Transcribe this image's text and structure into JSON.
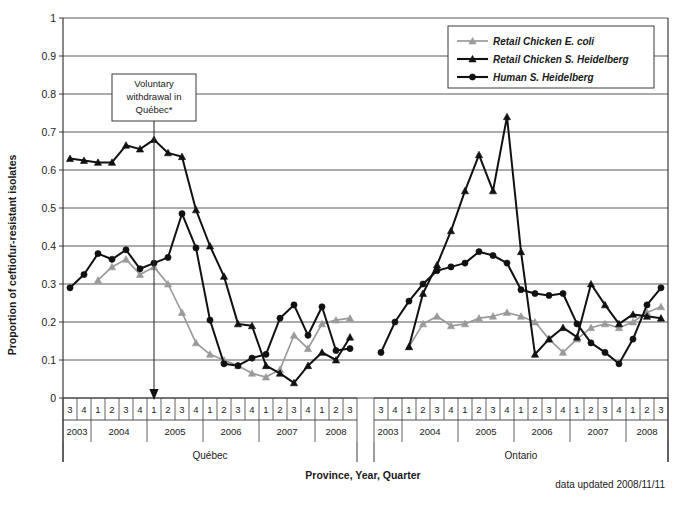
{
  "axes": {
    "ylabel": "Proportion of ceftiofur-resistant isolates",
    "xtitle": "Province, Year, Quarter",
    "yticks": [
      "0",
      "0.1",
      "0.2",
      "0.3",
      "0.4",
      "0.5",
      "0.6",
      "0.7",
      "0.8",
      "0.9",
      "1"
    ],
    "ylim": [
      0,
      1
    ]
  },
  "annotation": {
    "line1": "Voluntary",
    "line2": "withdrawal in",
    "line3": "Québec*"
  },
  "footer": {
    "note": "data updated 2008/11/11"
  },
  "legend": {
    "items": [
      {
        "label": "Retail Chicken E. coli",
        "color": "#9a9a9a",
        "marker": "triangle"
      },
      {
        "label": "Retail Chicken S. Heidelberg",
        "color": "#111111",
        "marker": "triangle"
      },
      {
        "label": "Human S. Heidelberg",
        "color": "#111111",
        "marker": "circle"
      }
    ]
  },
  "panels": [
    {
      "name": "Québec",
      "label": "Québec"
    },
    {
      "name": "Ontario",
      "label": "Ontario"
    }
  ],
  "quarter_labels": [
    "3",
    "4",
    "1",
    "2",
    "3",
    "4",
    "1",
    "2",
    "3",
    "4",
    "1",
    "2",
    "3",
    "4",
    "1",
    "2",
    "3",
    "4",
    "1",
    "2",
    "3"
  ],
  "year_groups": [
    {
      "year": "2003",
      "span": 2
    },
    {
      "year": "2004",
      "span": 4
    },
    {
      "year": "2005",
      "span": 4
    },
    {
      "year": "2006",
      "span": 4
    },
    {
      "year": "2007",
      "span": 4
    },
    {
      "year": "2008",
      "span": 3
    }
  ],
  "chart_data": {
    "type": "line",
    "title": "",
    "xlabel": "Province, Year, Quarter",
    "ylabel": "Proportion of ceftiofur-resistant isolates",
    "ylim": [
      0,
      1
    ],
    "grid": true,
    "legend_position": "top-right",
    "annotations": [
      {
        "text": "Voluntary withdrawal in Québec*",
        "at_panel": "Québec",
        "at_x": "2005 Q1"
      }
    ],
    "x": [
      "2003 Q3",
      "2003 Q4",
      "2004 Q1",
      "2004 Q2",
      "2004 Q3",
      "2004 Q4",
      "2005 Q1",
      "2005 Q2",
      "2005 Q3",
      "2005 Q4",
      "2006 Q1",
      "2006 Q2",
      "2006 Q3",
      "2006 Q4",
      "2007 Q1",
      "2007 Q2",
      "2007 Q3",
      "2007 Q4",
      "2008 Q1",
      "2008 Q2",
      "2008 Q3"
    ],
    "panels": [
      {
        "panel": "Québec",
        "series": [
          {
            "name": "Retail Chicken E. coli",
            "color": "#9a9a9a",
            "values": [
              null,
              null,
              0.31,
              0.345,
              0.365,
              0.325,
              0.345,
              0.3,
              0.225,
              0.145,
              0.115,
              0.1,
              0.085,
              0.065,
              0.055,
              0.075,
              0.165,
              0.13,
              0.195,
              0.205,
              0.21
            ]
          },
          {
            "name": "Retail Chicken S. Heidelberg",
            "color": "#111111",
            "values": [
              0.63,
              0.625,
              0.62,
              0.62,
              0.665,
              0.655,
              0.68,
              0.645,
              0.635,
              0.495,
              0.4,
              0.32,
              0.195,
              0.19,
              0.085,
              0.065,
              0.04,
              0.085,
              0.12,
              0.1,
              0.16
            ]
          },
          {
            "name": "Human S. Heidelberg",
            "color": "#111111",
            "values": [
              0.29,
              0.325,
              0.38,
              0.365,
              0.39,
              0.34,
              0.355,
              0.37,
              0.485,
              0.395,
              0.205,
              0.09,
              0.085,
              0.105,
              0.115,
              0.21,
              0.245,
              0.165,
              0.24,
              0.125,
              0.13
            ]
          }
        ]
      },
      {
        "panel": "Ontario",
        "series": [
          {
            "name": "Retail Chicken E. coli",
            "color": "#9a9a9a",
            "values": [
              null,
              null,
              0.135,
              0.195,
              0.215,
              0.19,
              0.195,
              0.21,
              0.215,
              0.225,
              0.215,
              0.2,
              0.155,
              0.12,
              0.155,
              0.185,
              0.195,
              0.185,
              0.2,
              0.225,
              0.24
            ]
          },
          {
            "name": "Retail Chicken S. Heidelberg",
            "color": "#111111",
            "values": [
              null,
              null,
              0.135,
              0.275,
              0.35,
              0.44,
              0.545,
              0.64,
              0.545,
              0.74,
              0.385,
              0.115,
              0.155,
              0.185,
              0.16,
              0.3,
              0.245,
              0.195,
              0.22,
              0.215,
              0.21
            ]
          },
          {
            "name": "Human S. Heidelberg",
            "color": "#111111",
            "values": [
              0.12,
              0.2,
              0.255,
              0.3,
              0.335,
              0.345,
              0.355,
              0.385,
              0.375,
              0.355,
              0.285,
              0.275,
              0.27,
              0.275,
              0.195,
              0.145,
              0.12,
              0.09,
              0.155,
              0.245,
              0.29
            ]
          }
        ]
      }
    ]
  }
}
